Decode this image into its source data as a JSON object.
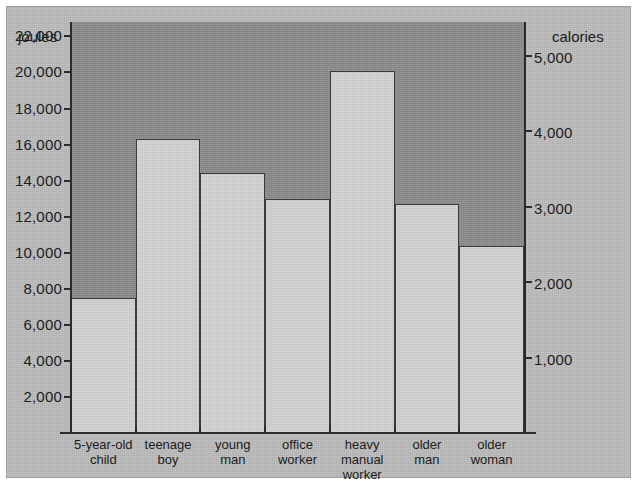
{
  "chart_data": {
    "type": "bar",
    "title": "",
    "categories": [
      "5-year-old\nchild",
      "teenage\nboy",
      "young\nman",
      "office\nworker",
      "heavy\nmanual\nworker",
      "older\nman",
      "older\nwoman"
    ],
    "values": [
      7500,
      16300,
      14400,
      13000,
      20100,
      12700,
      10400
    ],
    "values_calories": [
      1790,
      3890,
      3440,
      3100,
      4800,
      3030,
      2480
    ],
    "xlabel": "",
    "ylabel": "joules",
    "ylabel_right": "calories",
    "ylim": [
      0,
      22800
    ],
    "ylim_right": [
      0,
      5450
    ],
    "grid": false,
    "legend": "none",
    "left_axis": {
      "title": "joules",
      "ticks": [
        2000,
        4000,
        6000,
        8000,
        10000,
        12000,
        14000,
        16000,
        18000,
        20000,
        22000
      ],
      "tick_labels": [
        "2,000",
        "4,000",
        "6,000",
        "8,000",
        "10,000",
        "12,000",
        "14,000",
        "16,000",
        "18,000",
        "20,000",
        "22,000"
      ]
    },
    "right_axis": {
      "title": "calories",
      "ticks": [
        1000,
        2000,
        3000,
        4000,
        5000
      ],
      "tick_labels": [
        "1,000",
        "2,000",
        "3,000",
        "4,000",
        "5,000"
      ]
    },
    "colors": {
      "panel_background": "#bdbdbd",
      "plot_background": "#8e8e8e",
      "bar_fill": "#d0d0d0",
      "bar_outline": "#3a3a3a",
      "axis": "#2b2b2b",
      "text": "#1c1c1c"
    }
  }
}
